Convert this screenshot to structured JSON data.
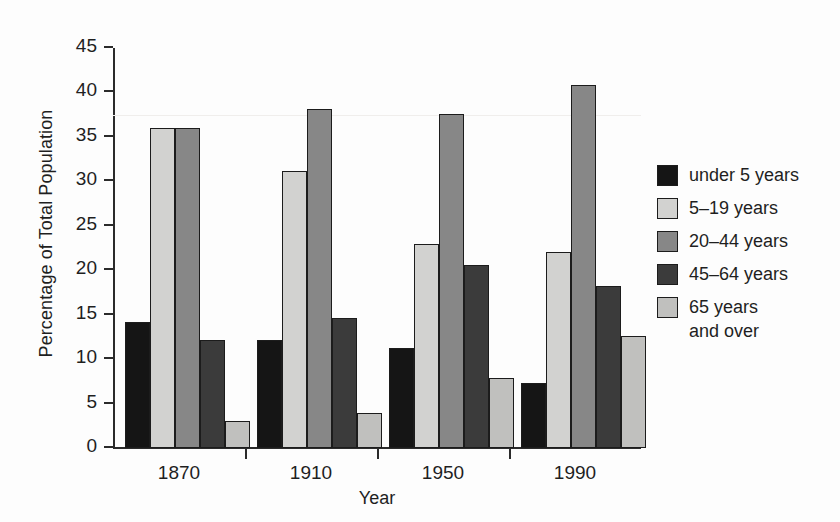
{
  "chart_data": {
    "type": "bar",
    "title": "",
    "xlabel": "Year",
    "ylabel": "Percentage of Total Population",
    "categories": [
      "1870",
      "1910",
      "1950",
      "1990"
    ],
    "ylim": [
      0,
      45
    ],
    "yticks": [
      0,
      5,
      10,
      15,
      20,
      25,
      30,
      35,
      40,
      45
    ],
    "ytick_labels": [
      "0",
      "5",
      "10",
      "15",
      "20",
      "25",
      "30",
      "35",
      "40",
      "45"
    ],
    "grid": false,
    "legend_position": "right",
    "series": [
      {
        "name": "under 5 years",
        "color": "#151515",
        "values": [
          14.2,
          12.1,
          11.2,
          7.3
        ]
      },
      {
        "name": "5–19 years",
        "color": "#d2d2d0",
        "values": [
          36.0,
          31.2,
          23.0,
          22.0
        ]
      },
      {
        "name": "20–44 years",
        "color": "#878787",
        "values": [
          36.0,
          38.1,
          37.6,
          40.8
        ]
      },
      {
        "name": "45–64 years",
        "color": "#3b3b3b",
        "values": [
          12.2,
          14.6,
          20.6,
          18.2
        ]
      },
      {
        "name": "65 years\nand over",
        "color": "#c0c0be",
        "values": [
          3.0,
          3.9,
          7.9,
          12.6
        ]
      }
    ]
  },
  "axes": {
    "y_title": "Percentage of Total Population",
    "x_title": "Year"
  },
  "legend": {
    "entries": [
      "under 5 years",
      "5–19 years",
      "20–44 years",
      "45–64 years",
      "65 years\nand over"
    ]
  },
  "colors": {
    "background": "#fdfdfd",
    "axis": "#2b2b2b",
    "text": "#1f1f1f",
    "bar_outline": "#1c1c1c"
  }
}
